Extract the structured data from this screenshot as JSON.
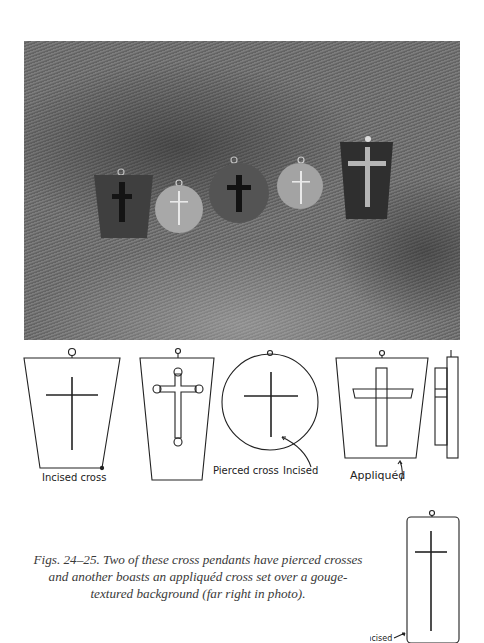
{
  "figure": {
    "photo": {
      "description": "Five cross pendants on gouge-textured fabric",
      "pendants": [
        {
          "shape": "trapezoid",
          "tone": "dark",
          "cross": "dark pierced"
        },
        {
          "shape": "circle",
          "tone": "light",
          "cross": "light incised"
        },
        {
          "shape": "circle",
          "tone": "dark",
          "cross": "dark pierced"
        },
        {
          "shape": "circle",
          "tone": "light",
          "cross": "light incised"
        },
        {
          "shape": "trapezoid",
          "tone": "dark",
          "cross": "light appliqued"
        }
      ]
    },
    "drawing_labels": {
      "incised_cross": "Incised cross",
      "pierced_cross": "Pierced cross",
      "incised": "Incised",
      "appliqued": "Appliquéd",
      "incised_final": "Incised"
    },
    "caption": {
      "line1": "Figs. 24–25. Two of these cross pendants have pierced crosses",
      "line2": "and another boasts an appliquéd cross set over a gouge-",
      "line3": "textured background (far right in photo)."
    }
  },
  "colors": {
    "ink": "#222222",
    "caption_text": "#3a3a3a",
    "photo_base": "#6e6e6e"
  }
}
